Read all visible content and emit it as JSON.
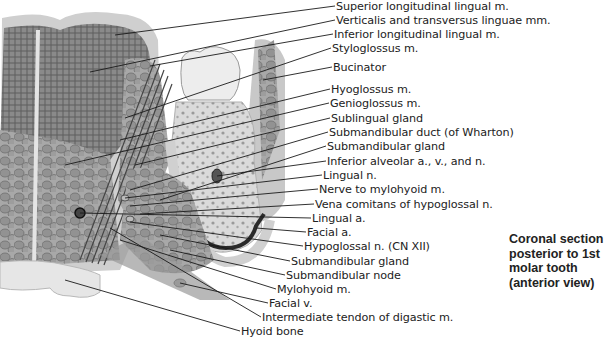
{
  "figure": {
    "title": "Coronal section posterior to 1st molar tooth (anterior view)",
    "caption_lines": [
      "Coronal section",
      "posterior to 1st",
      "molar tooth",
      "(anterior view)"
    ]
  },
  "labels": [
    {
      "text": "Superior longitudinal lingual m.",
      "x": 336,
      "y": 0
    },
    {
      "text": "Verticalis and transversus linguae mm.",
      "x": 336,
      "y": 14
    },
    {
      "text": "Inferior longitudinal lingual m.",
      "x": 334,
      "y": 28
    },
    {
      "text": "Styloglossus m.",
      "x": 332,
      "y": 42
    },
    {
      "text": "Bucinator",
      "x": 333,
      "y": 61
    },
    {
      "text": "Hyoglossus m.",
      "x": 331,
      "y": 83
    },
    {
      "text": "Genioglossus m.",
      "x": 330,
      "y": 97
    },
    {
      "text": "Sublingual gland",
      "x": 331,
      "y": 112
    },
    {
      "text": "Submandibular duct (of Wharton)",
      "x": 329,
      "y": 126
    },
    {
      "text": "Submandibular gland",
      "x": 327,
      "y": 140
    },
    {
      "text": "Inferior alveolar a., v., and n.",
      "x": 327,
      "y": 155
    },
    {
      "text": "Lingual n.",
      "x": 323,
      "y": 169
    },
    {
      "text": "Nerve to mylohyoid m.",
      "x": 319,
      "y": 183
    },
    {
      "text": "Vena comitans of hypoglossal n.",
      "x": 315,
      "y": 198
    },
    {
      "text": "Lingual a.",
      "x": 312,
      "y": 212
    },
    {
      "text": "Facial a.",
      "x": 307,
      "y": 226
    },
    {
      "text": "Hypoglossal n. (CN XII)",
      "x": 304,
      "y": 240
    },
    {
      "text": "Submandibular gland",
      "x": 291,
      "y": 255
    },
    {
      "text": "Submandibular node",
      "x": 286,
      "y": 269
    },
    {
      "text": "Mylohyoid m.",
      "x": 277,
      "y": 283
    },
    {
      "text": "Facial v.",
      "x": 269,
      "y": 297
    },
    {
      "text": "Intermediate tendon of digastic m.",
      "x": 262,
      "y": 311
    },
    {
      "text": "Hyoid bone",
      "x": 241,
      "y": 325
    }
  ],
  "colors": {
    "text": "#222222",
    "leader": "#1a1a1a",
    "muscle_dark": "#6e6e6e",
    "muscle_mid": "#9a9a9a",
    "tissue_light": "#d4d4d4",
    "bone": "#e8e8e8"
  }
}
